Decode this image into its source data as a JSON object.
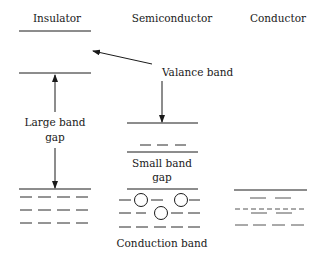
{
  "diagram": {
    "type": "band-gap-comparison",
    "columns": [
      {
        "id": "insulator",
        "title": "Insulator"
      },
      {
        "id": "semiconductor",
        "title": "Semiconductor"
      },
      {
        "id": "conductor",
        "title": "Conductor"
      }
    ],
    "labels": {
      "valance_band": "Valance band",
      "large_gap_line1": "Large band",
      "large_gap_line2": "gap",
      "small_gap_line1": "Small band",
      "small_gap_line2": "gap",
      "conduction_band": "Conduction band"
    },
    "colors": {
      "stroke": "#1a1a1a",
      "background": "#ffffff"
    }
  }
}
